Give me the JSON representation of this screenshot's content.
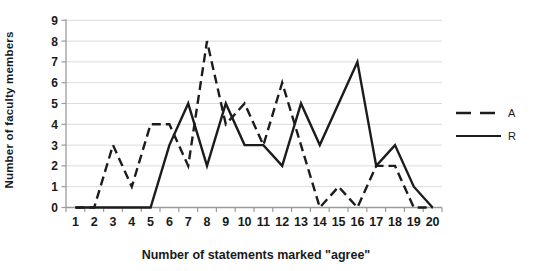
{
  "chart_data": {
    "type": "line",
    "title": "",
    "xlabel": "Number of statements marked \"agree\"",
    "ylabel": "Number of faculty members",
    "x": [
      1,
      2,
      3,
      4,
      5,
      6,
      7,
      8,
      9,
      10,
      11,
      12,
      13,
      14,
      15,
      16,
      17,
      18,
      19,
      20
    ],
    "ylim": [
      0,
      9
    ],
    "ytick_step": 1,
    "grid": true,
    "legend_position": "right",
    "series": [
      {
        "name": "A",
        "line_style": "dashed",
        "values": [
          0,
          0,
          3,
          1,
          4,
          4,
          2,
          8,
          4,
          5,
          3,
          6,
          3,
          0,
          1,
          0,
          2,
          2,
          0,
          0
        ]
      },
      {
        "name": "R",
        "line_style": "solid",
        "values": [
          0,
          0,
          0,
          0,
          0,
          3,
          5,
          2,
          5,
          3,
          3,
          2,
          5,
          3,
          5,
          7,
          2,
          3,
          1,
          0
        ]
      }
    ]
  },
  "colors": {
    "line": "#1c1c1c",
    "grid": "#dcdcdc",
    "axis": "#9b9b9b",
    "tick_label": "#1a1a1a",
    "background": "#ffffff"
  }
}
